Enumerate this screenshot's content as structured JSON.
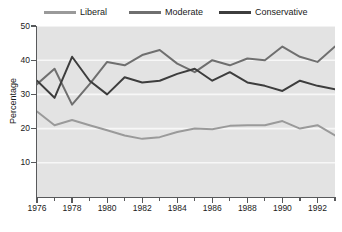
{
  "legend": {
    "position": "top",
    "items": [
      {
        "label": "Liberal",
        "color": "#9a9a9a",
        "icon": "line-swatch-icon"
      },
      {
        "label": "Moderate",
        "color": "#6f6f6f",
        "icon": "line-swatch-icon"
      },
      {
        "label": "Conservative",
        "color": "#3d3d3d",
        "icon": "line-swatch-icon"
      }
    ]
  },
  "axes": {
    "ylabel": "Percentage",
    "yticks": [
      "10",
      "20",
      "30",
      "40",
      "50"
    ],
    "xticks": [
      "1976",
      "1978",
      "1980",
      "1982",
      "1984",
      "1986",
      "1988",
      "1990",
      "1992"
    ]
  },
  "colors": {
    "plot_background": "#e3e3e3",
    "gridline": "#f7f7f7",
    "axis": "#58595b",
    "text": "#1a1a1a",
    "page_background": "#ffffff"
  },
  "chart_data": {
    "type": "line",
    "title": "",
    "xlabel": "",
    "ylabel": "Percentage",
    "xlim": [
      1976,
      1993
    ],
    "ylim": [
      0,
      50
    ],
    "grid": true,
    "legend_position": "top",
    "x": [
      1976,
      1977,
      1978,
      1979,
      1980,
      1981,
      1982,
      1983,
      1984,
      1985,
      1986,
      1987,
      1988,
      1989,
      1990,
      1991,
      1992,
      1993
    ],
    "xtick_labels": [
      "1976",
      "1978",
      "1980",
      "1982",
      "1984",
      "1986",
      "1988",
      "1990",
      "1992"
    ],
    "ytick_labels": [
      "10",
      "20",
      "30",
      "40",
      "50"
    ],
    "series": [
      {
        "name": "Liberal",
        "color": "#9a9a9a",
        "values": [
          25.0,
          21.0,
          22.5,
          21.0,
          19.5,
          18.0,
          17.0,
          17.5,
          19.0,
          20.0,
          19.8,
          20.8,
          21.0,
          21.0,
          22.2,
          20.0,
          21.0,
          18.0
        ]
      },
      {
        "name": "Moderate",
        "color": "#6f6f6f",
        "values": [
          33.0,
          37.5,
          27.0,
          33.0,
          39.5,
          38.5,
          41.5,
          43.0,
          39.0,
          36.5,
          40.0,
          38.5,
          40.5,
          40.0,
          44.0,
          41.0,
          39.5,
          44.0
        ]
      },
      {
        "name": "Conservative",
        "color": "#3d3d3d",
        "values": [
          34.0,
          29.0,
          41.0,
          34.0,
          30.0,
          35.0,
          33.5,
          34.0,
          36.0,
          37.5,
          34.0,
          36.5,
          33.5,
          32.5,
          31.0,
          34.0,
          32.5,
          31.5
        ]
      }
    ]
  }
}
